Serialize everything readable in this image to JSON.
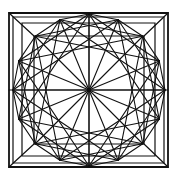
{
  "figure": {
    "width": 174,
    "height": 178,
    "background": "#ffffff",
    "stroke_color": "#111111",
    "center": [
      89,
      90
    ],
    "outer_squares": [
      {
        "x": 9,
        "y": 13,
        "w": 159,
        "h": 154,
        "stroke_width": 1.8
      },
      {
        "x": 13,
        "y": 17,
        "w": 151,
        "h": 146,
        "stroke_width": 1.2
      },
      {
        "x": 22,
        "y": 23,
        "w": 133,
        "h": 133,
        "stroke_width": 1.2
      },
      {
        "x": 34,
        "y": 36,
        "w": 110,
        "h": 108,
        "stroke_width": 1.2
      }
    ],
    "star": {
      "points": 16,
      "radius": 76,
      "rotation_deg": 0,
      "step_connections": [
        1,
        3,
        5,
        8
      ],
      "stroke_width": 1.1
    },
    "corner_diagonals": [
      [
        9,
        13,
        34,
        36
      ],
      [
        168,
        13,
        144,
        36
      ],
      [
        9,
        167,
        34,
        144
      ],
      [
        168,
        167,
        144,
        144
      ]
    ],
    "axis_lines": [
      [
        89,
        13,
        89,
        167
      ],
      [
        9,
        90,
        168,
        90
      ]
    ]
  }
}
